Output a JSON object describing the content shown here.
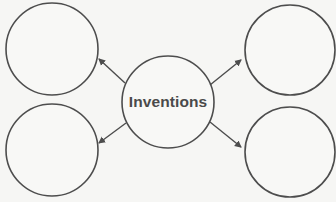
{
  "diagram": {
    "type": "concept-web",
    "center": {
      "label": "Inventions",
      "cx": 168,
      "cy": 102,
      "r": 46
    },
    "nodes": [
      {
        "id": "top-left",
        "label": "",
        "cx": 52,
        "cy": 49,
        "r": 46
      },
      {
        "id": "top-right",
        "label": "",
        "cx": 290,
        "cy": 50,
        "r": 45
      },
      {
        "id": "bottom-left",
        "label": "",
        "cx": 52,
        "cy": 150,
        "r": 46
      },
      {
        "id": "bottom-right",
        "label": "",
        "cx": 290,
        "cy": 152,
        "r": 45
      }
    ],
    "arrows": [
      {
        "to": "top-left",
        "x1": 125,
        "y1": 83,
        "x2": 99,
        "y2": 59
      },
      {
        "to": "top-right",
        "x1": 210,
        "y1": 85,
        "x2": 241,
        "y2": 60
      },
      {
        "to": "bottom-left",
        "x1": 126,
        "y1": 123,
        "x2": 99,
        "y2": 143
      },
      {
        "to": "bottom-right",
        "x1": 210,
        "y1": 122,
        "x2": 241,
        "y2": 147
      }
    ],
    "colors": {
      "stroke": "#4d4d4d",
      "fill": "#f8f8f6",
      "text": "#4a4a4a"
    }
  }
}
